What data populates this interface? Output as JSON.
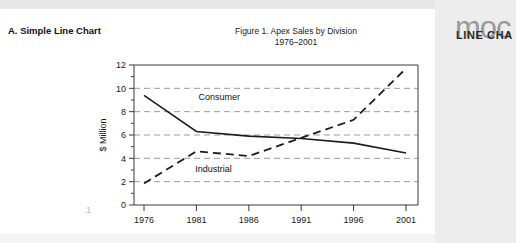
{
  "section": {
    "heading": "A. Simple Line Chart"
  },
  "figure": {
    "title_line1": "Figure 1.  Apex Sales by Division",
    "title_line2": "1976–2001"
  },
  "page": {
    "number": "1"
  },
  "brand": {
    "wordmark": "moc",
    "subtitle": "LINE CHA"
  },
  "colors": {
    "page_background": "#ffffff",
    "panel_background": "#ededed",
    "top_band": "#e8e8e8",
    "axis": "#3b3b3b",
    "gridline": "#9d9d9d",
    "series": "#1d1d1d",
    "text": "#1a1a1a",
    "wordmark": "#9a9a9a"
  },
  "chart_data": {
    "type": "line",
    "title": "Figure 1.  Apex Sales by Division 1976–2001",
    "xlabel": "",
    "ylabel": "$ Million",
    "categories": [
      "1976",
      "1981",
      "1986",
      "1991",
      "1996",
      "2001"
    ],
    "x": [
      1976,
      1981,
      1986,
      1991,
      1996,
      2001
    ],
    "xlim": [
      1976,
      2001
    ],
    "ylim": [
      0,
      12
    ],
    "yticks": [
      0,
      2,
      4,
      6,
      8,
      10,
      12
    ],
    "xticks": [
      1976,
      1981,
      1986,
      1991,
      1996,
      2001
    ],
    "grid": "horizontal-dashed",
    "legend": "inline-annotations",
    "series": [
      {
        "name": "Consumer",
        "style": "solid",
        "label_x": 1981.2,
        "label_y": 9.0,
        "values": [
          9.4,
          6.3,
          5.9,
          5.7,
          5.3,
          4.45
        ]
      },
      {
        "name": "Industrial",
        "style": "dashed",
        "label_x": 1980.9,
        "label_y": 2.85,
        "values": [
          1.85,
          4.6,
          4.2,
          5.75,
          7.3,
          11.7
        ]
      }
    ]
  }
}
